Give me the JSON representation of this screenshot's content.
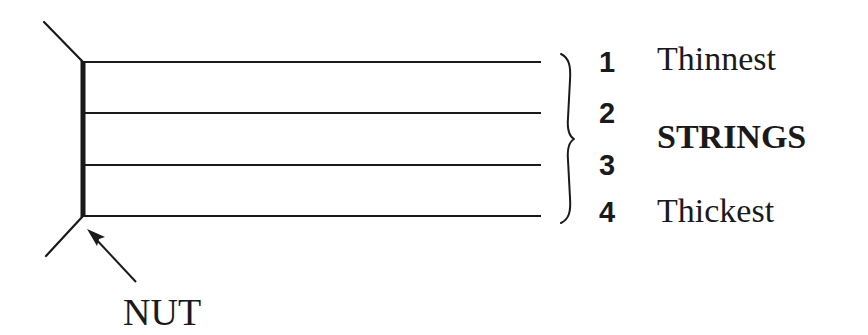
{
  "diagram": {
    "colors": {
      "ink": "#1a1a1a",
      "background": "#ffffff"
    },
    "strings": [
      {
        "number": "1",
        "y": 62
      },
      {
        "number": "2",
        "y": 113
      },
      {
        "number": "3",
        "y": 165
      },
      {
        "number": "4",
        "y": 216
      }
    ],
    "labels": {
      "thinnest": "Thinnest",
      "strings": "STRINGS",
      "thickest": "Thickest",
      "nut": "NUT"
    },
    "numbers": {
      "n1": "1",
      "n2": "2",
      "n3": "3",
      "n4": "4"
    }
  }
}
